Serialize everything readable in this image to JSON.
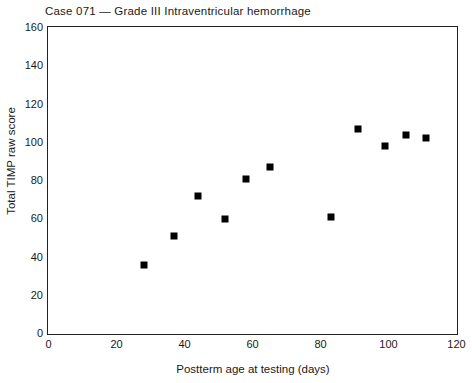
{
  "chart_data": {
    "type": "scatter",
    "title": "Case 071 — Grade III Intraventricular hemorrhage",
    "xlabel": "Postterm age at testing (days)",
    "ylabel": "Total TIMP raw score",
    "xlim": [
      0,
      120
    ],
    "ylim": [
      0,
      160
    ],
    "x_ticks": [
      0,
      20,
      40,
      60,
      80,
      100,
      120
    ],
    "y_ticks": [
      0,
      20,
      40,
      60,
      80,
      100,
      120,
      140,
      160
    ],
    "grid": false,
    "legend": false,
    "frame": "full-box",
    "marker": {
      "shape": "square",
      "color": "#000000"
    },
    "points": [
      {
        "x": 28,
        "y": 36
      },
      {
        "x": 37,
        "y": 51
      },
      {
        "x": 44,
        "y": 72
      },
      {
        "x": 52,
        "y": 60
      },
      {
        "x": 58,
        "y": 81
      },
      {
        "x": 65,
        "y": 87
      },
      {
        "x": 83,
        "y": 61
      },
      {
        "x": 91,
        "y": 107
      },
      {
        "x": 99,
        "y": 98
      },
      {
        "x": 105,
        "y": 104
      },
      {
        "x": 111,
        "y": 102
      }
    ]
  },
  "colors": {
    "background": "#ffffff",
    "text": "#1a1a1a",
    "axis": "#222222",
    "marker": "#000000"
  }
}
